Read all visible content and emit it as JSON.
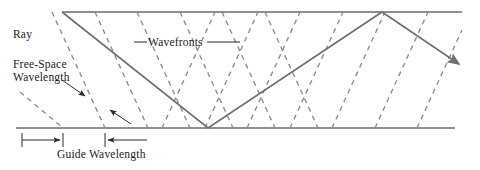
{
  "figure": {
    "background_color": "#ffffff",
    "width": 480,
    "height": 170
  },
  "labels": {
    "ray": "Ray",
    "free_space_wavelength_line1": "Free-Space",
    "free_space_wavelength_line2": "Wavelength",
    "wavefronts": "Wavefronts",
    "guide_wavelength": "Guide Wavelength"
  },
  "colors": {
    "wall": "#6b6b6b",
    "ray": "#6e6e6e",
    "wavefront": "#8c8c8c",
    "dimension": "#2b2b2b",
    "text": "#1a1a1a",
    "leader": "#2b2b2b"
  },
  "geometry": {
    "top_wall": {
      "x1": 62,
      "y1": 12,
      "x2": 462,
      "y2": 12
    },
    "bottom_wall": {
      "x1": 16,
      "y1": 128,
      "x2": 455,
      "y2": 128
    },
    "ray_path": [
      {
        "x": 62,
        "y": 12
      },
      {
        "x": 208,
        "y": 128
      },
      {
        "x": 382,
        "y": 12
      },
      {
        "x": 463,
        "y": 67
      }
    ],
    "ray_arrow_tip": {
      "x": 463,
      "y": 67
    },
    "wavefronts_down": [
      {
        "x1": 20,
        "y1": 92,
        "x2": 63,
        "y2": 128
      },
      {
        "x1": 52,
        "y1": 12,
        "x2": 105,
        "y2": 128
      },
      {
        "x1": 95,
        "y1": 12,
        "x2": 148,
        "y2": 128
      },
      {
        "x1": 137,
        "y1": 12,
        "x2": 190,
        "y2": 128
      },
      {
        "x1": 180,
        "y1": 12,
        "x2": 233,
        "y2": 128
      },
      {
        "x1": 222,
        "y1": 12,
        "x2": 275,
        "y2": 128
      },
      {
        "x1": 265,
        "y1": 12,
        "x2": 318,
        "y2": 128
      }
    ],
    "wavefronts_up": [
      {
        "x1": 162,
        "y1": 128,
        "x2": 215,
        "y2": 12
      },
      {
        "x1": 205,
        "y1": 128,
        "x2": 258,
        "y2": 12
      },
      {
        "x1": 247,
        "y1": 128,
        "x2": 300,
        "y2": 12
      },
      {
        "x1": 290,
        "y1": 128,
        "x2": 343,
        "y2": 12
      },
      {
        "x1": 332,
        "y1": 128,
        "x2": 385,
        "y2": 12
      },
      {
        "x1": 375,
        "y1": 128,
        "x2": 428,
        "y2": 12
      },
      {
        "x1": 417,
        "y1": 128,
        "x2": 462,
        "y2": 30
      }
    ]
  },
  "annotations": {
    "free_space_arrow": {
      "x1": 64,
      "y1": 82,
      "x2": 84,
      "y2": 95
    },
    "guide_angle_arrow": {
      "x1": 129,
      "y1": 122,
      "x2": 109,
      "y2": 110
    },
    "wavefront_leader_left": {
      "x1": 136,
      "y1": 42,
      "x2": 146,
      "y2": 42
    },
    "wavefront_leader_right": {
      "x1": 207,
      "y1": 42,
      "x2": 238,
      "y2": 42
    },
    "dimension_line": {
      "y": 140,
      "left_tick_x": 22,
      "mid_tick_x": 63,
      "right_tick_x": 105,
      "end_x": 147
    }
  }
}
